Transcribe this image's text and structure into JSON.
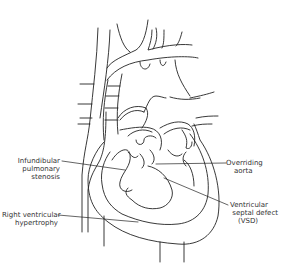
{
  "diagram": {
    "line_color": "#222222",
    "labels": [
      {
        "id": "infundibular",
        "lines": [
          "Infundibular",
          "pulmonary",
          "stenosis"
        ]
      },
      {
        "id": "overriding",
        "lines": [
          "Overriding",
          "aorta"
        ]
      },
      {
        "id": "vsd",
        "lines": [
          "Ventricular",
          "septal defect",
          "(VSD)"
        ]
      },
      {
        "id": "rvh",
        "lines": [
          "Right ventricular",
          "hypertrophy"
        ]
      }
    ]
  }
}
